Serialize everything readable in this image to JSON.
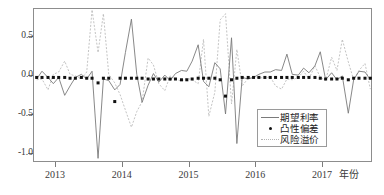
{
  "chart_data": {
    "type": "line",
    "title": "",
    "xlabel": "年份",
    "ylabel": "",
    "xlim": [
      2012.67,
      2017.75
    ],
    "ylim": [
      -1.12,
      0.86
    ],
    "grid": false,
    "legend_position": "inside-bottom-right",
    "x_tick_labels": [
      "2013",
      "2014",
      "2015",
      "2016",
      "2017"
    ],
    "x_tick_values": [
      2013,
      2014,
      2015,
      2016,
      2017
    ],
    "y_tick_labels": [
      "0.5",
      "0.0",
      "-0.5",
      "-1.0"
    ],
    "y_tick_values": [
      0.5,
      0.0,
      -0.5,
      -1.0
    ],
    "x": [
      2012.71,
      2012.79,
      2012.88,
      2012.96,
      2013.04,
      2013.13,
      2013.21,
      2013.29,
      2013.38,
      2013.46,
      2013.54,
      2013.63,
      2013.71,
      2013.79,
      2013.88,
      2013.96,
      2014.04,
      2014.13,
      2014.21,
      2014.29,
      2014.38,
      2014.46,
      2014.54,
      2014.63,
      2014.71,
      2014.79,
      2014.88,
      2014.96,
      2015.04,
      2015.13,
      2015.21,
      2015.29,
      2015.38,
      2015.46,
      2015.54,
      2015.63,
      2015.71,
      2015.79,
      2015.88,
      2015.96,
      2016.04,
      2016.13,
      2016.21,
      2016.29,
      2016.38,
      2016.46,
      2016.54,
      2016.63,
      2016.71,
      2016.79,
      2016.88,
      2016.96,
      2017.04,
      2017.13,
      2017.21,
      2017.29,
      2017.38,
      2017.46,
      2017.54,
      2017.63,
      2017.71
    ],
    "series": [
      {
        "name": "期望利率",
        "style": "solid",
        "color": "#7a7a7a",
        "values": [
          -0.04,
          0.06,
          -0.02,
          -0.1,
          -0.02,
          -0.25,
          -0.13,
          -0.02,
          0.02,
          -0.04,
          0.06,
          -1.06,
          -0.04,
          -0.06,
          -0.18,
          -0.11,
          0.3,
          0.73,
          0.02,
          -0.34,
          -0.12,
          0.03,
          -0.08,
          0.01,
          -0.06,
          0.03,
          0.07,
          0.06,
          0.19,
          0.4,
          -0.07,
          -0.14,
          0.17,
          0.09,
          -0.49,
          0.49,
          -0.87,
          -0.02,
          -0.04,
          -0.02,
          0.02,
          0.05,
          0.05,
          0.08,
          0.07,
          0.28,
          0.02,
          0.01,
          0.1,
          0.04,
          0.13,
          0.31,
          -0.05,
          0.04,
          -0.05,
          0.0,
          -0.48,
          -0.05,
          0.06,
          0.05,
          -0.05
        ]
      },
      {
        "name": "凸性偏差",
        "style": "dotted-markers",
        "color": "#111111",
        "values": [
          -0.02,
          -0.02,
          -0.02,
          -0.02,
          -0.02,
          -0.02,
          -0.03,
          -0.03,
          -0.02,
          -0.03,
          -0.03,
          -0.09,
          -0.03,
          -0.03,
          -0.33,
          -0.03,
          -0.03,
          -0.03,
          -0.03,
          -0.03,
          -0.04,
          -0.04,
          -0.04,
          -0.04,
          -0.04,
          -0.04,
          -0.05,
          -0.05,
          -0.04,
          -0.03,
          -0.03,
          -0.03,
          -0.03,
          -0.05,
          -0.26,
          -0.05,
          -0.03,
          -0.02,
          -0.02,
          -0.02,
          -0.02,
          -0.02,
          -0.02,
          -0.02,
          -0.02,
          -0.02,
          -0.02,
          -0.02,
          -0.02,
          -0.02,
          -0.02,
          -0.03,
          -0.04,
          -0.04,
          -0.04,
          -0.03,
          -0.05,
          -0.03,
          -0.03,
          -0.03,
          -0.03
        ]
      },
      {
        "name": "风险溢价",
        "style": "dashed",
        "color": "#b4b4b4",
        "values": [
          -0.05,
          -0.04,
          -0.18,
          0.02,
          0.05,
          0.19,
          0.02,
          0.0,
          -0.04,
          0.05,
          0.85,
          0.3,
          0.8,
          0.02,
          -0.09,
          -0.24,
          -0.44,
          -0.66,
          -0.46,
          -0.33,
          0.23,
          0.14,
          -0.1,
          -0.19,
          0.0,
          -0.04,
          -0.07,
          -0.03,
          -0.05,
          -0.1,
          0.47,
          -0.52,
          -0.21,
          0.72,
          0.8,
          -0.36,
          0.34,
          -0.13,
          -0.03,
          -0.02,
          -0.02,
          -0.03,
          -0.01,
          -0.13,
          -0.17,
          -0.04,
          -0.05,
          -0.02,
          0.06,
          -0.04,
          0.13,
          -0.02,
          -0.06,
          0.24,
          0.07,
          0.47,
          0.18,
          -0.05,
          0.07,
          0.16,
          -0.17
        ]
      }
    ]
  },
  "axes": {
    "y_ticks": [
      {
        "label": "0.5",
        "value": 0.5
      },
      {
        "label": "0.0",
        "value": 0.0
      },
      {
        "label": "-0.5",
        "value": -0.5
      },
      {
        "label": "-1.0",
        "value": -1.0
      }
    ],
    "x_ticks": [
      {
        "label": "2013",
        "value": 2013
      },
      {
        "label": "2014",
        "value": 2014
      },
      {
        "label": "2015",
        "value": 2015
      },
      {
        "label": "2016",
        "value": 2016
      },
      {
        "label": "2017",
        "value": 2017
      }
    ],
    "x_title": "年份"
  },
  "legend": {
    "items": [
      {
        "label": "期望利率",
        "style": "solid"
      },
      {
        "label": "凸性偏差",
        "style": "dot"
      },
      {
        "label": "风险溢价",
        "style": "dashed"
      }
    ]
  },
  "caption": ""
}
